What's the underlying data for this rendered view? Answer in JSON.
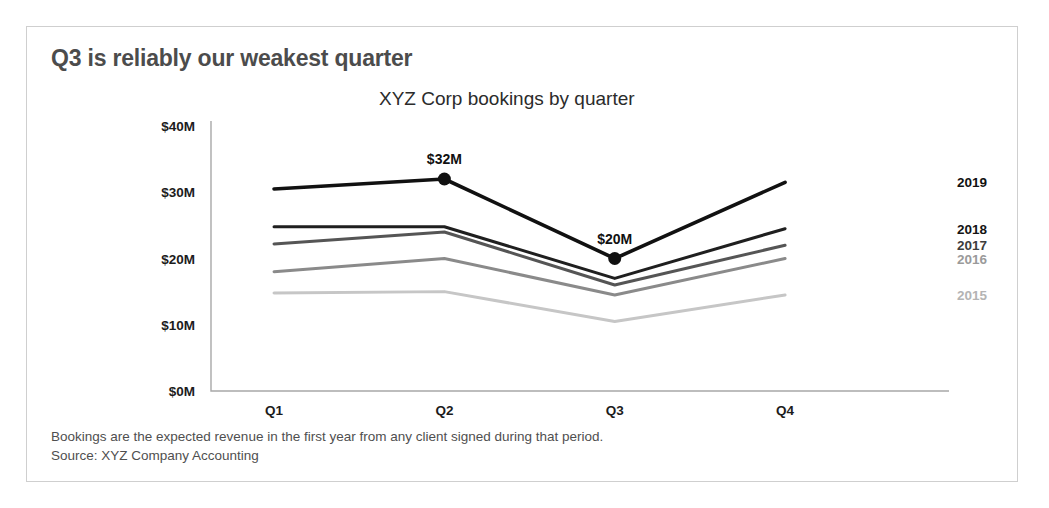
{
  "card": {
    "border_color": "#cfcfcf",
    "background": "#ffffff"
  },
  "title": "Q3 is reliably our weakest quarter",
  "subtitle": "XYZ Corp bookings by quarter",
  "footnote": {
    "line1": "Bookings are the expected revenue in the first year from any client signed during that period.",
    "line2": "Source: XYZ Company Accounting"
  },
  "chart_data": {
    "type": "line",
    "title": "Q3 is reliably our weakest quarter",
    "subtitle": "XYZ Corp bookings by quarter",
    "xlabel": "",
    "ylabel": "",
    "categories": [
      "Q1",
      "Q2",
      "Q3",
      "Q4"
    ],
    "ylim": [
      0,
      40
    ],
    "ytick_labels": [
      "$0M",
      "$10M",
      "$20M",
      "$30M",
      "$40M"
    ],
    "ytick_values": [
      0,
      10,
      20,
      30,
      40
    ],
    "grid": false,
    "legend_position": "right-inline",
    "units": "millions of USD",
    "series": [
      {
        "name": "2019",
        "values": [
          30.5,
          32,
          20,
          31.5
        ],
        "color": "#111111",
        "width": 3.6,
        "label_color": "#111111",
        "markers": [
          {
            "category": "Q2",
            "value": 32,
            "label": "$32M",
            "label_position": "above"
          },
          {
            "category": "Q3",
            "value": 20,
            "label": "$20M",
            "label_position": "above"
          }
        ]
      },
      {
        "name": "2018",
        "values": [
          24.8,
          24.8,
          17.0,
          24.5
        ],
        "color": "#1f1f1f",
        "width": 3.0,
        "label_color": "#141414",
        "markers": []
      },
      {
        "name": "2017",
        "values": [
          22.2,
          24.0,
          16.0,
          22.0
        ],
        "color": "#555555",
        "width": 3.0,
        "label_color": "#3d3d3d",
        "markers": []
      },
      {
        "name": "2016",
        "values": [
          18.0,
          20.0,
          14.5,
          20.0
        ],
        "color": "#8a8a8a",
        "width": 3.0,
        "label_color": "#9a9a9a",
        "markers": []
      },
      {
        "name": "2015",
        "values": [
          14.8,
          15.0,
          10.5,
          14.5
        ],
        "color": "#c6c6c6",
        "width": 3.0,
        "label_color": "#b4b4b4",
        "markers": []
      }
    ],
    "axis_color": "#a8a8a8"
  }
}
